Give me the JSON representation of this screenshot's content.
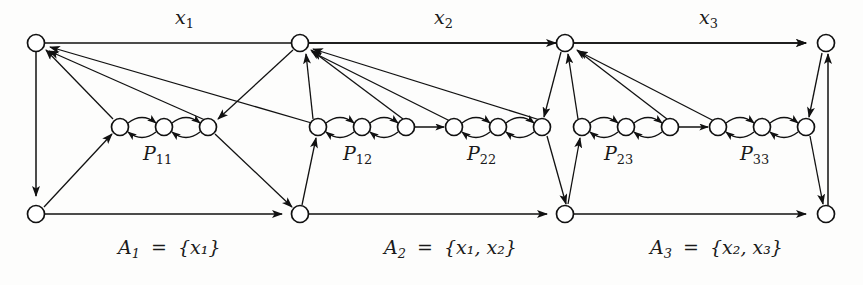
{
  "figure": {
    "kind": "directed-graph-diagram",
    "background": "#fdfdfc",
    "ink": "#111111",
    "node_fill": "#ffffff"
  },
  "top_edge_labels": [
    {
      "id": "x1",
      "text": "x₁",
      "base": "x",
      "sub": "1",
      "x": 175,
      "y": 8
    },
    {
      "id": "x2",
      "text": "x₂",
      "base": "x",
      "sub": "2",
      "x": 434,
      "y": 8
    },
    {
      "id": "x3",
      "text": "x₃",
      "base": "x",
      "sub": "3",
      "x": 699,
      "y": 8
    }
  ],
  "chain_labels": [
    {
      "id": "P11",
      "base": "P",
      "sub": "11",
      "x": 143,
      "y": 142
    },
    {
      "id": "P12",
      "base": "P",
      "sub": "12",
      "x": 343,
      "y": 142
    },
    {
      "id": "P22",
      "base": "P",
      "sub": "22",
      "x": 467,
      "y": 142
    },
    {
      "id": "P23",
      "base": "P",
      "sub": "23",
      "x": 604,
      "y": 142
    },
    {
      "id": "P33",
      "base": "P",
      "sub": "33",
      "x": 740,
      "y": 142
    }
  ],
  "set_labels": [
    {
      "id": "A1",
      "base": "A",
      "sub": "1",
      "eq": "=",
      "set": "{x₁}",
      "elements": [
        "x₁"
      ],
      "x": 118,
      "y": 238
    },
    {
      "id": "A2",
      "base": "A",
      "sub": "2",
      "eq": "=",
      "set": "{x₁, x₂}",
      "elements": [
        "x₁",
        "x₂"
      ],
      "x": 384,
      "y": 238
    },
    {
      "id": "A3",
      "base": "A",
      "sub": "3",
      "eq": "=",
      "set": "{x₂, x₃}",
      "elements": [
        "x₂",
        "x₃"
      ],
      "x": 650,
      "y": 238
    }
  ],
  "nodes": {
    "top": [
      {
        "id": "t1",
        "x": 36,
        "y": 43
      },
      {
        "id": "t2",
        "x": 300,
        "y": 43
      },
      {
        "id": "t3",
        "x": 565,
        "y": 43
      },
      {
        "id": "t4",
        "x": 826,
        "y": 43
      }
    ],
    "bottom": [
      {
        "id": "b1",
        "x": 36,
        "y": 214
      },
      {
        "id": "b2",
        "x": 300,
        "y": 214
      },
      {
        "id": "b3",
        "x": 565,
        "y": 214
      },
      {
        "id": "b4",
        "x": 826,
        "y": 214
      }
    ],
    "chains": [
      {
        "id": "P11",
        "y": 127,
        "nodes": [
          120,
          164,
          208
        ]
      },
      {
        "id": "P12",
        "y": 127,
        "nodes": [
          318,
          362,
          406
        ]
      },
      {
        "id": "P22",
        "y": 127,
        "nodes": [
          454,
          498,
          542
        ]
      },
      {
        "id": "P23",
        "y": 127,
        "nodes": [
          582,
          626,
          670
        ]
      },
      {
        "id": "P33",
        "y": 127,
        "nodes": [
          718,
          762,
          806
        ]
      }
    ],
    "radius": 8.5
  },
  "edges": {
    "top_rail": [
      {
        "from": "t1",
        "to": "t2",
        "label": "x1"
      },
      {
        "from": "t2",
        "to": "t3",
        "label": "x2"
      },
      {
        "from": "t3",
        "to": "t4",
        "label": "x3"
      }
    ],
    "bottom_rail": [
      {
        "from": "b1",
        "to": "b2"
      },
      {
        "from": "b2",
        "to": "b3"
      },
      {
        "from": "b3",
        "to": "b4"
      }
    ],
    "verticals": [
      {
        "from": "t1",
        "to": "b1",
        "direction": "down"
      },
      {
        "from": "b4",
        "to": "t4",
        "direction": "up"
      }
    ]
  }
}
